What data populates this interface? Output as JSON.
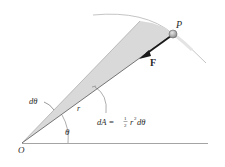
{
  "diagram": {
    "type": "physics-central-force-area-sweep",
    "labels": {
      "point_P": "P",
      "force": "F",
      "origin": "O",
      "angle": "θ",
      "d_angle": "dθ",
      "radius": "r",
      "area_lhs": "dA = ",
      "half_num": "1",
      "half_den": "2",
      "area_r": "r",
      "area_exp": "2",
      "area_dtheta": "dθ"
    },
    "colors": {
      "wedge_fill": "#d9d9d9",
      "line": "#555555",
      "arc": "#bdbdbd",
      "arrow": "#1a1a1a",
      "ball": "#a8a8a8",
      "baseline": "#9a9a9a"
    }
  }
}
